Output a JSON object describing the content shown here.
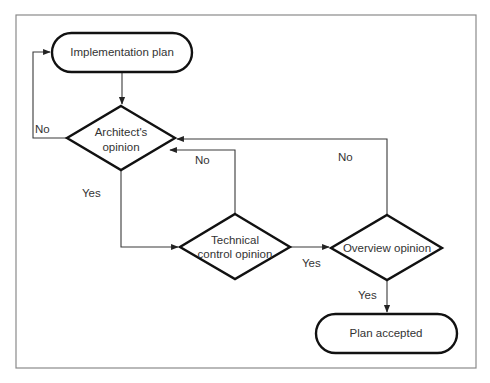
{
  "diagram": {
    "type": "flowchart",
    "nodes": {
      "implementation_plan": {
        "shape": "terminator",
        "lines": [
          "Implementation plan"
        ]
      },
      "architect": {
        "shape": "decision",
        "lines": [
          "Architect's",
          "opinion"
        ]
      },
      "technical": {
        "shape": "decision",
        "lines": [
          "Technical",
          "control opinion"
        ]
      },
      "overview": {
        "shape": "decision",
        "lines": [
          "Overview opinion"
        ]
      },
      "plan_accepted": {
        "shape": "terminator",
        "lines": [
          "Plan accepted"
        ]
      }
    },
    "edges": [
      {
        "from": "implementation_plan",
        "to": "architect",
        "label": ""
      },
      {
        "from": "architect",
        "to": "implementation_plan",
        "label": "No"
      },
      {
        "from": "architect",
        "to": "technical",
        "label": "Yes"
      },
      {
        "from": "technical",
        "to": "architect",
        "label": "No"
      },
      {
        "from": "technical",
        "to": "overview",
        "label": "Yes"
      },
      {
        "from": "overview",
        "to": "architect",
        "label": "No"
      },
      {
        "from": "overview",
        "to": "plan_accepted",
        "label": "Yes"
      }
    ],
    "labels": {
      "architect_no": "No",
      "architect_yes": "Yes",
      "technical_no": "No",
      "technical_yes": "Yes",
      "overview_no": "No",
      "overview_yes": "Yes"
    }
  }
}
